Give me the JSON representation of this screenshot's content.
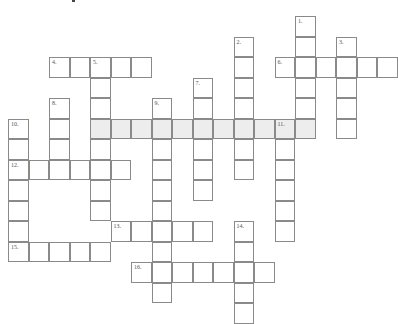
{
  "puzzle": {
    "type": "crossword",
    "grid": {
      "origin_x": 8,
      "origin_y": 16,
      "cell_size": 20.5,
      "line_color": "#8a8a8a",
      "shaded_color": "#ededed"
    },
    "entries": [
      {
        "number": "1.",
        "direction": "down",
        "col": 14,
        "row": 0,
        "length": 6
      },
      {
        "number": "2.",
        "direction": "down",
        "col": 11,
        "row": 1,
        "length": 7
      },
      {
        "number": "3.",
        "direction": "down",
        "col": 16,
        "row": 1,
        "length": 5
      },
      {
        "number": "4.",
        "direction": "across",
        "col": 2,
        "row": 2,
        "length": 5
      },
      {
        "number": "5.",
        "direction": "down",
        "col": 4,
        "row": 2,
        "length": 8
      },
      {
        "number": "6.",
        "direction": "across",
        "col": 13,
        "row": 2,
        "length": 6
      },
      {
        "number": "7.",
        "direction": "down",
        "col": 9,
        "row": 3,
        "length": 6
      },
      {
        "number": "8.",
        "direction": "down",
        "col": 2,
        "row": 4,
        "length": 4
      },
      {
        "number": "9.",
        "direction": "down",
        "col": 7,
        "row": 4,
        "length": 10
      },
      {
        "number": "10.",
        "direction": "down",
        "col": 0,
        "row": 5,
        "length": 7
      },
      {
        "number": "11.",
        "direction": "down",
        "col": 13,
        "row": 5,
        "length": 6
      },
      {
        "number": "",
        "direction": "across",
        "col": 4,
        "row": 5,
        "length": 11,
        "shaded": true
      },
      {
        "number": "12.",
        "direction": "across",
        "col": 0,
        "row": 7,
        "length": 6
      },
      {
        "number": "13.",
        "direction": "across",
        "col": 5,
        "row": 10,
        "length": 5
      },
      {
        "number": "14.",
        "direction": "down",
        "col": 11,
        "row": 10,
        "length": 5
      },
      {
        "number": "15.",
        "direction": "across",
        "col": 0,
        "row": 11,
        "length": 5
      },
      {
        "number": "16.",
        "direction": "across",
        "col": 6,
        "row": 12,
        "length": 7
      }
    ]
  }
}
